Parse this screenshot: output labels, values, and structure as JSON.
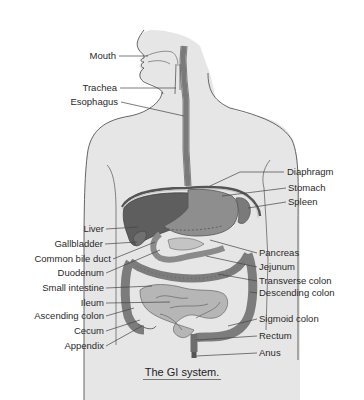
{
  "diagram": {
    "title": "The GI system.",
    "colors": {
      "skin": "#e4e4e4",
      "outline": "#555555",
      "organ_dark": "#5e5e5e",
      "organ_mid": "#8c8c8c",
      "organ_light": "#b4b4b4",
      "leader": "#444444",
      "text": "#2a2a2a"
    },
    "labels_left": [
      {
        "text": "Mouth",
        "x": 116,
        "y": 54
      },
      {
        "text": "Trachea",
        "x": 117,
        "y": 87
      },
      {
        "text": "Esophagus",
        "x": 118,
        "y": 101
      },
      {
        "text": "Liver",
        "x": 104,
        "y": 228
      },
      {
        "text": "Gallbladder",
        "x": 103,
        "y": 243
      },
      {
        "text": "Common bile duct",
        "x": 111,
        "y": 258
      },
      {
        "text": "Duodenum",
        "x": 104,
        "y": 272
      },
      {
        "text": "Small intestine",
        "x": 104,
        "y": 287
      },
      {
        "text": "Ileum",
        "x": 104,
        "y": 302
      },
      {
        "text": "Ascending colon",
        "x": 104,
        "y": 315
      },
      {
        "text": "Cecum",
        "x": 104,
        "y": 330
      },
      {
        "text": "Appendix",
        "x": 104,
        "y": 345
      }
    ],
    "labels_right": [
      {
        "text": "Diaphragm",
        "x": 286,
        "y": 171
      },
      {
        "text": "Stomach",
        "x": 288,
        "y": 187
      },
      {
        "text": "Spleen",
        "x": 288,
        "y": 201
      },
      {
        "text": "Pancreas",
        "x": 259,
        "y": 252
      },
      {
        "text": "Jejunum",
        "x": 259,
        "y": 266
      },
      {
        "text": "Transverse colon",
        "x": 259,
        "y": 280
      },
      {
        "text": "Descending colon",
        "x": 259,
        "y": 292
      },
      {
        "text": "Sigmoid colon",
        "x": 259,
        "y": 318
      },
      {
        "text": "Rectum",
        "x": 259,
        "y": 335
      },
      {
        "text": "Anus",
        "x": 259,
        "y": 352
      }
    ]
  }
}
